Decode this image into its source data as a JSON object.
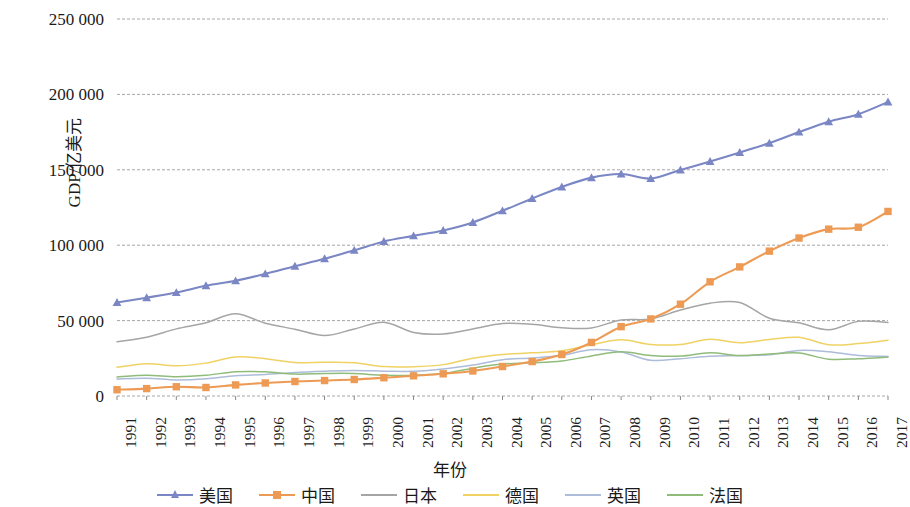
{
  "chart_data": {
    "type": "line",
    "title": "",
    "xlabel": "年份",
    "ylabel": "GDP/亿美元",
    "ylim": [
      0,
      250000
    ],
    "ytick_labels": [
      "250 000",
      "200 000",
      "150 000",
      "100 000",
      "50 000",
      "0"
    ],
    "ytick_values": [
      250000,
      200000,
      150000,
      100000,
      50000,
      0
    ],
    "grid": true,
    "legend_position": "bottom",
    "categories": [
      "1991",
      "1992",
      "1993",
      "1994",
      "1995",
      "1996",
      "1997",
      "1998",
      "1999",
      "2000",
      "2001",
      "2002",
      "2003",
      "2004",
      "2005",
      "2006",
      "2007",
      "2008",
      "2009",
      "2010",
      "2011",
      "2012",
      "2013",
      "2014",
      "2015",
      "2016",
      "2017"
    ],
    "series": [
      {
        "name": "美国",
        "color": "#7B86C4",
        "marker": "triangle",
        "values": [
          62000,
          65200,
          68600,
          73100,
          76400,
          81000,
          86100,
          91000,
          96600,
          102500,
          106200,
          109800,
          115100,
          122800,
          131000,
          138600,
          144800,
          147200,
          144200,
          149900,
          155500,
          161500,
          167700,
          175000,
          181900,
          186900,
          195000
        ]
      },
      {
        "name": "中国",
        "color": "#ED9B54",
        "marker": "square",
        "values": [
          4150,
          4920,
          6130,
          5640,
          7345,
          8638,
          9616,
          10247,
          10941,
          12113,
          13394,
          14705,
          16606,
          19554,
          22860,
          27522,
          35522,
          45982,
          51100,
          60870,
          75730,
          85600,
          96070,
          104760,
          110640,
          111910,
          122380
        ]
      },
      {
        "name": "日本",
        "color": "#A5A5A5",
        "marker": "none",
        "values": [
          36000,
          39000,
          44500,
          48600,
          54500,
          48300,
          44300,
          40100,
          44400,
          48870,
          42180,
          41150,
          44450,
          48150,
          47560,
          45300,
          45150,
          50380,
          51060,
          57000,
          61570,
          62030,
          51560,
          48500,
          43890,
          49490,
          48720
        ]
      },
      {
        "name": "德国",
        "color": "#F0D264",
        "marker": "none",
        "values": [
          19000,
          21400,
          20060,
          21800,
          25860,
          24730,
          22180,
          22370,
          22040,
          19490,
          19400,
          20800,
          25060,
          27530,
          28610,
          29970,
          34000,
          37300,
          34180,
          34170,
          37570,
          35340,
          37520,
          38900,
          34020,
          34770,
          36930
        ]
      },
      {
        "name": "英国",
        "color": "#ADBCD8",
        "marker": "none",
        "values": [
          11300,
          11800,
          10630,
          11400,
          13440,
          14280,
          15600,
          16390,
          16880,
          16490,
          16400,
          17860,
          20530,
          24110,
          25200,
          26980,
          30740,
          29230,
          23670,
          24750,
          26300,
          26760,
          27390,
          30220,
          29330,
          26890,
          26220
        ]
      },
      {
        "name": "法国",
        "color": "#8FBC7A",
        "marker": "none",
        "values": [
          12640,
          13800,
          12770,
          13700,
          16100,
          16050,
          14520,
          14930,
          14910,
          13700,
          13800,
          14940,
          18470,
          21190,
          21970,
          23190,
          26600,
          29300,
          26930,
          26470,
          28680,
          26830,
          27860,
          28520,
          24380,
          24720,
          25820
        ]
      }
    ]
  },
  "legend": {
    "items": [
      {
        "label": "美国"
      },
      {
        "label": "中国"
      },
      {
        "label": "日本"
      },
      {
        "label": "德国"
      },
      {
        "label": "英国"
      },
      {
        "label": "法国"
      }
    ]
  }
}
